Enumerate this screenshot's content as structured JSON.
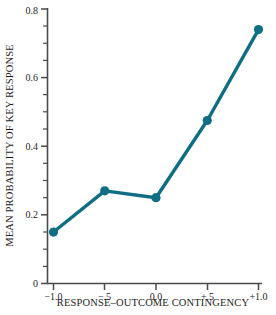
{
  "chart_data": {
    "type": "line",
    "title": "",
    "xlabel": "RESPONSE–OUTCOME CONTINGENCY",
    "ylabel": "MEAN PROBABILITY OF KEY RESPONSE",
    "x": [
      -1.0,
      -0.5,
      0.0,
      0.5,
      1.0
    ],
    "categories": [
      "−1.0",
      "−.5",
      "0.0",
      "+.5",
      "+1.0"
    ],
    "values": [
      0.15,
      0.27,
      0.25,
      0.475,
      0.74
    ],
    "series": [
      {
        "name": "Mean probability of key response",
        "values": [
          0.15,
          0.27,
          0.25,
          0.475,
          0.74
        ]
      }
    ],
    "xlim": [
      -1.0,
      1.0
    ],
    "ylim": [
      0,
      0.8
    ],
    "ytick_labels": [
      "0",
      "0.2",
      "0.4",
      "0.6",
      "0.8"
    ],
    "ytick_values": [
      0,
      0.2,
      0.4,
      0.6,
      0.8
    ],
    "yminor_interval": 0.05,
    "xtick_labels": [
      "−1.0",
      "−.5",
      "0.0",
      "+.5",
      "+1.0"
    ],
    "grid": false,
    "legend": "none",
    "marker": "circle",
    "line_color": "#0F6E83",
    "marker_color": "#0F6E83",
    "axis_color": "#4a4a4a"
  }
}
